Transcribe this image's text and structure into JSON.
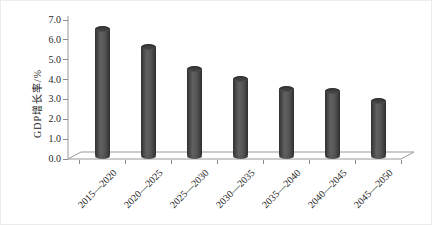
{
  "figure": {
    "background_color": "#ffffff",
    "bar_color": "#4a4a4a",
    "axis_color": "#999999",
    "text_color": "#262626"
  },
  "chart_data": {
    "type": "bar",
    "bar_style": "cylinder-3d",
    "title": "",
    "xlabel": "",
    "ylabel": "GDP增长率/%",
    "categories": [
      "2015—2020",
      "2020—2025",
      "2025—2030",
      "2030—2035",
      "2035—2040",
      "2040—2045",
      "2045—2050"
    ],
    "values": [
      6.5,
      5.6,
      4.5,
      4.0,
      3.5,
      3.4,
      2.9
    ],
    "ylim": [
      0.0,
      7.0
    ],
    "ytick_step": 1.0,
    "ytick_labels": [
      "0.0",
      "1.0",
      "2.0",
      "3.0",
      "4.0",
      "5.0",
      "6.0",
      "7.0"
    ],
    "grid": false,
    "legend_position": "none"
  }
}
